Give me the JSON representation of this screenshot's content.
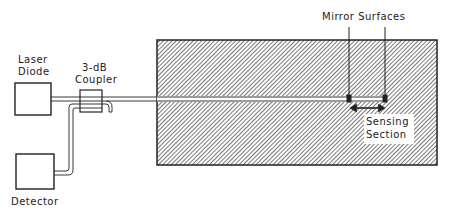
{
  "diagram": {
    "type": "fiber-optic-sensor-schematic",
    "colors": {
      "line": "#222222",
      "hatch": "#555555",
      "background": "#ffffff"
    },
    "components": {
      "laser_diode": {
        "label_line1": "Laser",
        "label_line2": "Diode"
      },
      "coupler": {
        "label_line1": "3-dB",
        "label_line2": "Coupler"
      },
      "detector": {
        "label": "Detector"
      },
      "mirrors": {
        "label": "Mirror Surfaces"
      },
      "sensing_section": {
        "label_line1": "Sensing",
        "label_line2": "Section"
      }
    }
  }
}
